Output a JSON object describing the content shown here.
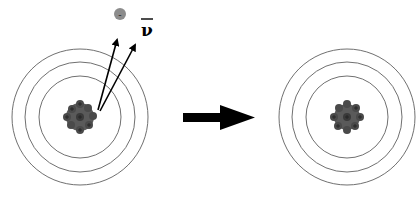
{
  "diagram": {
    "before_atom": {
      "center": [
        80,
        117
      ],
      "ring_radii": [
        41,
        55,
        68
      ],
      "nucleus_radius": 14
    },
    "after_atom": {
      "center": [
        347,
        117
      ],
      "ring_radii": [
        41,
        55,
        68
      ],
      "nucleus_radius": 13
    },
    "emitted": {
      "electron": {
        "symbol": "-",
        "color": "#8c8c8c"
      },
      "antineutrino": {
        "symbol": "ν",
        "bar": true
      }
    },
    "transition_arrow": {
      "color": "#000000"
    },
    "colors": {
      "ring": "#707070",
      "nucleus": "#5a5a5a",
      "nucleon_dark": "#3a3a3a"
    }
  }
}
